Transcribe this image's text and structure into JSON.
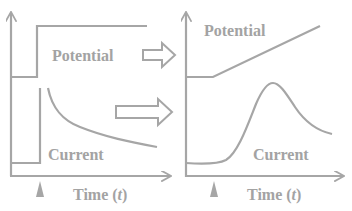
{
  "colors": {
    "line": "#a6a6a6",
    "text": "#a3a3a3",
    "background": "#ffffff"
  },
  "left_panel": {
    "title": "Potential step (chronoamperometry)",
    "potential_label": "Potential",
    "current_label": "Current",
    "time_label_prefix": "Time (",
    "time_label_var": "t",
    "time_label_suffix": ")"
  },
  "right_panel": {
    "title": "Potential sweep (voltammetry)",
    "potential_label": "Potential",
    "current_label": "Current",
    "time_label_prefix": "Time (",
    "time_label_var": "t",
    "time_label_suffix": ")"
  },
  "icons": {
    "transition_arrow_top": "hollow-right-arrow",
    "transition_arrow_bottom": "hollow-right-arrow",
    "start_marker": "triangle-up-marker"
  }
}
